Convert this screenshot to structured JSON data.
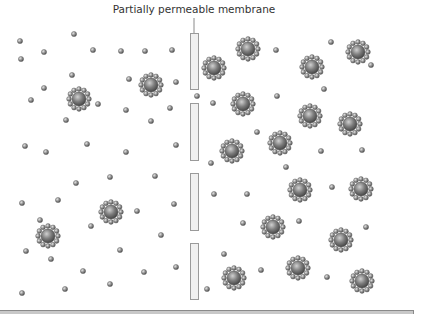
{
  "diagram": {
    "label": "Partially permeable membrane",
    "colors": {
      "membrane_fill": "#f0f0f0",
      "membrane_stroke": "#9a9a9a",
      "leader_line": "#8a8a8a",
      "particle_light": "#d8d8d8",
      "particle_mid": "#8c8c8c",
      "particle_dark": "#4a4a4a",
      "bottom_bar": "#c8c8c8"
    },
    "leader_line": {
      "x": 194,
      "y1": 18,
      "y2": 33
    },
    "membrane_segments": [
      {
        "x": 190,
        "y": 33,
        "w": 8,
        "h": 56
      },
      {
        "x": 190,
        "y": 103,
        "w": 8,
        "h": 57
      },
      {
        "x": 190,
        "y": 173,
        "w": 8,
        "h": 57
      },
      {
        "x": 190,
        "y": 243,
        "w": 8,
        "h": 56
      }
    ],
    "left_side": {
      "description": "dilute solution",
      "small_particles": [
        [
          20,
          41
        ],
        [
          74,
          34
        ],
        [
          44,
          52
        ],
        [
          21,
          59
        ],
        [
          93,
          50
        ],
        [
          121,
          51
        ],
        [
          145,
          51
        ],
        [
          172,
          50
        ],
        [
          72,
          75
        ],
        [
          129,
          79
        ],
        [
          176,
          82
        ],
        [
          44,
          88
        ],
        [
          31,
          100
        ],
        [
          98,
          104
        ],
        [
          126,
          110
        ],
        [
          170,
          108
        ],
        [
          66,
          120
        ],
        [
          151,
          121
        ],
        [
          25,
          146
        ],
        [
          46,
          152
        ],
        [
          87,
          144
        ],
        [
          126,
          152
        ],
        [
          176,
          145
        ],
        [
          76,
          183
        ],
        [
          110,
          177
        ],
        [
          155,
          176
        ],
        [
          22,
          203
        ],
        [
          58,
          200
        ],
        [
          137,
          211
        ],
        [
          174,
          204
        ],
        [
          40,
          220
        ],
        [
          91,
          226
        ],
        [
          161,
          235
        ],
        [
          26,
          251
        ],
        [
          51,
          259
        ],
        [
          120,
          250
        ],
        [
          83,
          271
        ],
        [
          144,
          272
        ],
        [
          176,
          267
        ],
        [
          110,
          284
        ],
        [
          22,
          293
        ],
        [
          65,
          289
        ]
      ],
      "large_particles": [
        [
          79,
          99
        ],
        [
          151,
          85
        ],
        [
          111,
          212
        ],
        [
          48,
          236
        ]
      ]
    },
    "right_side": {
      "description": "concentrated solution",
      "small_particles": [
        [
          276,
          50
        ],
        [
          331,
          42
        ],
        [
          371,
          65
        ],
        [
          197,
          96
        ],
        [
          213,
          103
        ],
        [
          277,
          96
        ],
        [
          324,
          89
        ],
        [
          257,
          132
        ],
        [
          321,
          151
        ],
        [
          362,
          150
        ],
        [
          211,
          163
        ],
        [
          286,
          167
        ],
        [
          214,
          194
        ],
        [
          247,
          194
        ],
        [
          332,
          187
        ],
        [
          243,
          223
        ],
        [
          299,
          221
        ],
        [
          366,
          227
        ],
        [
          224,
          254
        ],
        [
          261,
          270
        ],
        [
          327,
          277
        ],
        [
          207,
          289
        ]
      ],
      "large_particles": [
        [
          214,
          68
        ],
        [
          248,
          49
        ],
        [
          312,
          67
        ],
        [
          358,
          52
        ],
        [
          243,
          104
        ],
        [
          310,
          116
        ],
        [
          350,
          124
        ],
        [
          232,
          151
        ],
        [
          280,
          143
        ],
        [
          300,
          190
        ],
        [
          361,
          189
        ],
        [
          273,
          227
        ],
        [
          341,
          240
        ],
        [
          234,
          278
        ],
        [
          298,
          268
        ],
        [
          362,
          281
        ]
      ]
    },
    "particle_geometry": {
      "small_radius": 2.6,
      "large_core_radius": 7,
      "large_ring_radius": 10,
      "large_ring_bead_radius": 2.4,
      "large_ring_count": 12
    }
  }
}
